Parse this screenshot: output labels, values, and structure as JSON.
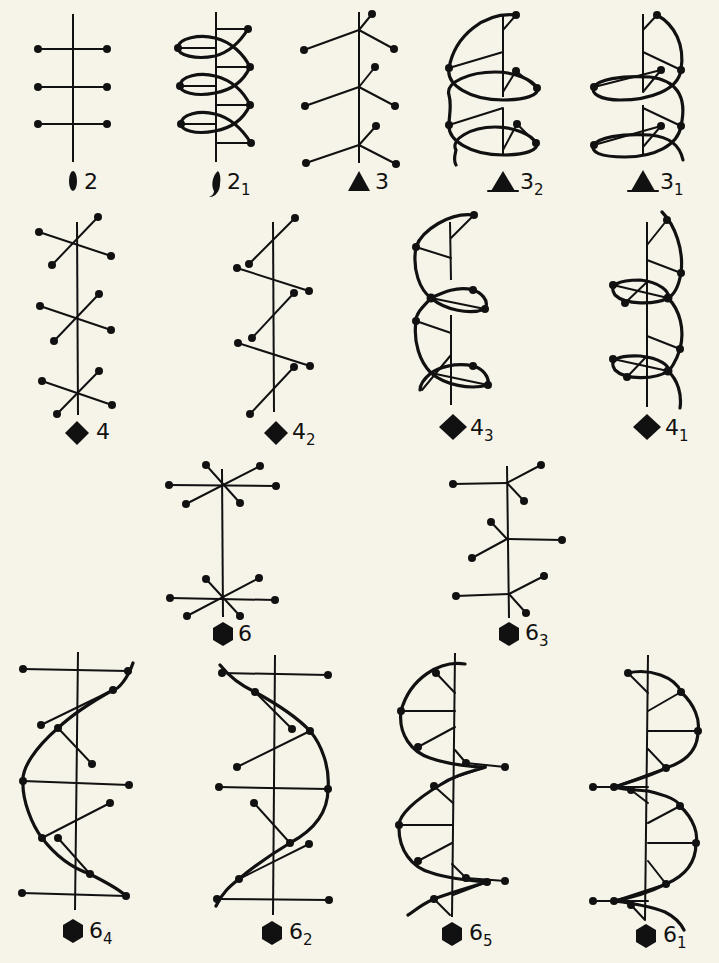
{
  "figure": {
    "background_color": "#f6f3e8",
    "ink_color": "#111111"
  },
  "axes": [
    {
      "id": "2",
      "symbol": "two-fold-lens-icon",
      "base": "2",
      "subscript": "",
      "type": "rotation axis"
    },
    {
      "id": "21",
      "symbol": "two-fold-screw-icon",
      "base": "2",
      "subscript": "1",
      "type": "screw axis"
    },
    {
      "id": "3",
      "symbol": "triangle-icon",
      "base": "3",
      "subscript": "",
      "type": "rotation axis"
    },
    {
      "id": "32",
      "symbol": "triangle-screw-icon",
      "base": "3",
      "subscript": "2",
      "type": "screw axis"
    },
    {
      "id": "31",
      "symbol": "triangle-screw-icon",
      "base": "3",
      "subscript": "1",
      "type": "screw axis"
    },
    {
      "id": "4",
      "symbol": "square-icon",
      "base": "4",
      "subscript": "",
      "type": "rotation axis"
    },
    {
      "id": "42",
      "symbol": "square-screw-icon",
      "base": "4",
      "subscript": "2",
      "type": "screw axis"
    },
    {
      "id": "43",
      "symbol": "square-screw-icon",
      "base": "4",
      "subscript": "3",
      "type": "screw axis"
    },
    {
      "id": "41",
      "symbol": "square-screw-icon",
      "base": "4",
      "subscript": "1",
      "type": "screw axis"
    },
    {
      "id": "6",
      "symbol": "hexagon-icon",
      "base": "6",
      "subscript": "",
      "type": "rotation axis"
    },
    {
      "id": "63",
      "symbol": "hexagon-screw-icon",
      "base": "6",
      "subscript": "3",
      "type": "screw axis"
    },
    {
      "id": "64",
      "symbol": "hexagon-screw-icon",
      "base": "6",
      "subscript": "4",
      "type": "screw axis"
    },
    {
      "id": "62",
      "symbol": "hexagon-screw-icon",
      "base": "6",
      "subscript": "2",
      "type": "screw axis"
    },
    {
      "id": "65",
      "symbol": "hexagon-screw-icon",
      "base": "6",
      "subscript": "5",
      "type": "screw axis"
    },
    {
      "id": "61",
      "symbol": "hexagon-screw-icon",
      "base": "6",
      "subscript": "1",
      "type": "screw axis"
    }
  ]
}
